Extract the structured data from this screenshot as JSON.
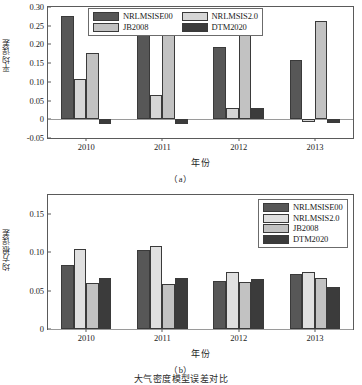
{
  "chart_data": [
    {
      "type": "bar",
      "panel": "a",
      "title": "",
      "subcaption": "（a）",
      "xlabel": "年份",
      "ylabel": "平均误差",
      "categories": [
        "2010",
        "2011",
        "2012",
        "2013"
      ],
      "ylim": [
        -0.05,
        0.3
      ],
      "yticks": [
        "0.30",
        "0.25",
        "0.20",
        "0.15",
        "0.10",
        "0.05",
        "0",
        "-0.05"
      ],
      "ytick_values": [
        0.3,
        0.25,
        0.2,
        0.15,
        0.1,
        0.05,
        0,
        -0.05
      ],
      "grid": false,
      "legend_position": "top-center",
      "series": [
        {
          "name": "NRLMSISE00",
          "color": "#575757",
          "values": [
            0.275,
            0.227,
            0.192,
            0.158
          ]
        },
        {
          "name": "NRLMSIS2.0",
          "color": "#d6d6d6",
          "values": [
            0.108,
            0.064,
            0.031,
            -0.006
          ]
        },
        {
          "name": "JB2008",
          "color": "#c2c2c2",
          "values": [
            0.178,
            0.237,
            0.224,
            0.263
          ]
        },
        {
          "name": "DTM2020",
          "color": "#3b3b3b",
          "values": [
            -0.012,
            -0.012,
            0.029,
            -0.01
          ]
        }
      ]
    },
    {
      "type": "bar",
      "panel": "b",
      "title": "",
      "subcaption": "（b）",
      "xlabel": "年份",
      "ylabel": "均方根误差",
      "categories": [
        "2010",
        "2011",
        "2012",
        "2013"
      ],
      "ylim": [
        0,
        0.175
      ],
      "yticks": [
        "0.15",
        "0.10",
        "0.05",
        "0"
      ],
      "ytick_values": [
        0.15,
        0.1,
        0.05,
        0
      ],
      "grid": false,
      "legend_position": "top-right",
      "series": [
        {
          "name": "NRLMSISE00",
          "color": "#575757",
          "values": [
            0.084,
            0.103,
            0.063,
            0.072
          ]
        },
        {
          "name": "NRLMSIS2.0",
          "color": "#e0e0e0",
          "values": [
            0.105,
            0.109,
            0.075,
            0.074
          ]
        },
        {
          "name": "JB2008",
          "color": "#c2c2c2",
          "values": [
            0.06,
            0.059,
            0.062,
            0.066
          ]
        },
        {
          "name": "DTM2020",
          "color": "#3b3b3b",
          "values": [
            0.066,
            0.066,
            0.065,
            0.055
          ]
        }
      ]
    }
  ],
  "figure": {
    "caption": "大气密度模型误差对比",
    "colors": {
      "nrlmsise00": "#575757",
      "nrlmsis20": "#e0e0e0",
      "jb2008": "#c2c2c2",
      "dtm2020": "#3b3b3b",
      "axis": "#5a5a5a",
      "baseline": "#9a9a9a"
    }
  }
}
